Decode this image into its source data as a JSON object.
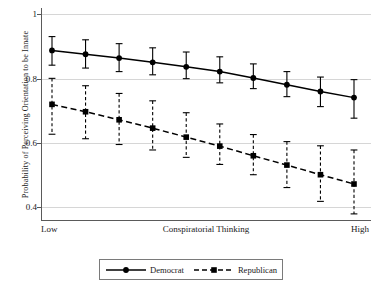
{
  "chart_data": {
    "type": "line",
    "title": "",
    "xlabel": "Conspiratorial Thinking",
    "ylabel": "Probability of Perceiving Orientation to be Innate",
    "xtick_labels": [
      "Low",
      "High"
    ],
    "ytick_labels": [
      "0.4",
      "0.6",
      "0.8",
      "1"
    ],
    "ytick_values": [
      0.4,
      0.6,
      0.8,
      1
    ],
    "ylim": [
      0.36,
      1.02
    ],
    "xlim": [
      0,
      9
    ],
    "grid": "horizontal",
    "legend_position": "below-axis",
    "x": [
      0,
      1,
      2,
      3,
      4,
      5,
      6,
      7,
      8,
      9
    ],
    "series": [
      {
        "name": "Democrat",
        "marker": "circle",
        "linestyle": "solid",
        "color": "#000000",
        "values": [
          0.888,
          0.876,
          0.864,
          0.851,
          0.837,
          0.822,
          0.802,
          0.781,
          0.76,
          0.741
        ],
        "ci_low": [
          0.842,
          0.833,
          0.822,
          0.812,
          0.8,
          0.787,
          0.769,
          0.744,
          0.713,
          0.677
        ],
        "ci_high": [
          0.931,
          0.921,
          0.909,
          0.896,
          0.883,
          0.868,
          0.846,
          0.822,
          0.805,
          0.797
        ]
      },
      {
        "name": "Republican",
        "marker": "square",
        "linestyle": "dashed",
        "color": "#000000",
        "values": [
          0.72,
          0.697,
          0.672,
          0.646,
          0.618,
          0.59,
          0.56,
          0.531,
          0.501,
          0.472
        ],
        "ci_low": [
          0.627,
          0.613,
          0.595,
          0.578,
          0.555,
          0.533,
          0.501,
          0.461,
          0.418,
          0.379
        ],
        "ci_high": [
          0.801,
          0.778,
          0.754,
          0.731,
          0.694,
          0.659,
          0.626,
          0.604,
          0.591,
          0.578
        ]
      }
    ]
  },
  "axes": {
    "ylabel": "Probability of Perceiving Orientation to be Innate",
    "xlabel": "Conspiratorial Thinking",
    "x_low_label": "Low",
    "x_high_label": "High",
    "yticks": [
      "1",
      "0.8",
      "0.6",
      "0.4"
    ]
  },
  "legend": {
    "items": [
      {
        "label": "Democrat"
      },
      {
        "label": "Republican"
      }
    ]
  }
}
